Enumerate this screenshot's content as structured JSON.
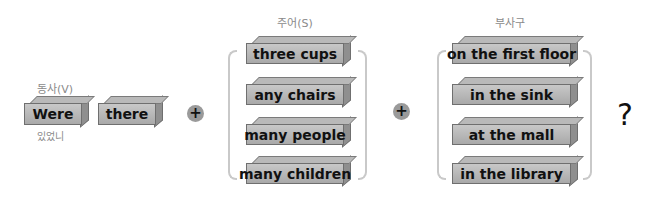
{
  "verb_section": {
    "label": "동사(V)",
    "blocks": [
      "Were",
      "there"
    ],
    "translation": "있었니"
  },
  "operators": {
    "plus_1": "+",
    "plus_2": "+"
  },
  "subject_section": {
    "label": "주어(S)",
    "blocks": [
      "three cups",
      "any chairs",
      "many people",
      "many children"
    ]
  },
  "adverb_section": {
    "label": "부사구",
    "blocks": [
      "on the first floor",
      "in the sink",
      "at the mall",
      "in the library"
    ]
  },
  "ending": {
    "mark": "?"
  },
  "colors": {
    "block_front": "#b4b4b4",
    "block_side": "#8f8f8f",
    "bracket": "#c9c9c9",
    "text": "#111111"
  }
}
